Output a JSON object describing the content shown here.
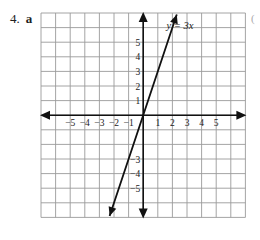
{
  "problem": {
    "number": "4.",
    "part": "a",
    "side_mark": "("
  },
  "colors": {
    "grid": "#9a9a9a",
    "axis": "#111111",
    "line": "#111111",
    "text": "#222222"
  },
  "chart_data": {
    "type": "line",
    "title": "",
    "xlabel": "",
    "ylabel": "",
    "grid": true,
    "xlim": [
      -7,
      7
    ],
    "ylim": [
      -7,
      7
    ],
    "x_tick_labels": [
      "−5",
      "−4",
      "−3",
      "−2",
      "−1",
      "1",
      "2",
      "3",
      "4",
      "5"
    ],
    "x_ticks": [
      -5,
      -4,
      -3,
      -2,
      -1,
      1,
      2,
      3,
      4,
      5
    ],
    "y_tick_labels": [
      "5",
      "4",
      "3",
      "2",
      "1",
      "−3",
      "−4",
      "−5"
    ],
    "y_ticks": [
      5,
      4,
      3,
      2,
      1,
      -3,
      -4,
      -5
    ],
    "series": [
      {
        "name": "y = 3x",
        "label": "y = 3x",
        "equation": "y = 3x",
        "x": [
          -2.3,
          2.3
        ],
        "y": [
          -6.9,
          6.9
        ],
        "arrows": "both"
      }
    ],
    "annotations": [
      {
        "text": "y = 3x",
        "x": 1.6,
        "y": 5.9
      }
    ]
  }
}
